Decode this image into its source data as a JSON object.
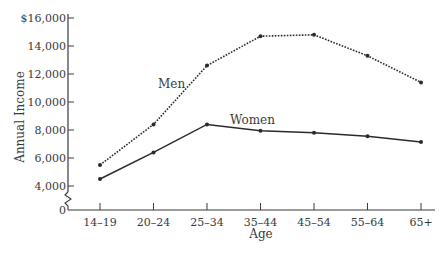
{
  "chart_data": {
    "type": "line",
    "title": "",
    "xlabel": "Age",
    "ylabel": "Annual Income",
    "categories": [
      "14–19",
      "20–24",
      "25–34",
      "35–44",
      "45–54",
      "55–64",
      "65+"
    ],
    "series": [
      {
        "name": "Men",
        "style": "dotted",
        "values": [
          5500,
          8400,
          12600,
          14700,
          14800,
          13300,
          11400
        ]
      },
      {
        "name": "Women",
        "style": "solid",
        "values": [
          4500,
          6400,
          8400,
          7950,
          7800,
          7550,
          7150
        ]
      }
    ],
    "yticks": [
      {
        "value": 16000,
        "label": "$16,000"
      },
      {
        "value": 14000,
        "label": "14,000"
      },
      {
        "value": 12000,
        "label": "12,000"
      },
      {
        "value": 10000,
        "label": "10,000"
      },
      {
        "value": 8000,
        "label": "8,000"
      },
      {
        "value": 6000,
        "label": "6,000"
      },
      {
        "value": 4000,
        "label": "4,000"
      },
      {
        "value": 0,
        "label": "0"
      }
    ],
    "ylim": [
      0,
      16000
    ],
    "axis_break": true,
    "grid": false,
    "legend_position": "inline labels"
  },
  "colors": {
    "line": "#2a2a2a",
    "axis": "#3a3a3a",
    "text": "#3a3a3a"
  }
}
